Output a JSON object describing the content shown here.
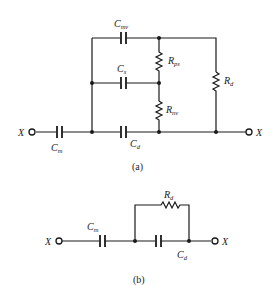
{
  "diagram_a": {
    "caption": "(a)",
    "terminal_left": "X",
    "terminal_right": "X",
    "components": {
      "C_mv": {
        "main": "C",
        "sub": "mv"
      },
      "C_s": {
        "main": "C",
        "sub": "s"
      },
      "C_d": {
        "main": "C",
        "sub": "d"
      },
      "C_m": {
        "main": "C",
        "sub": "m"
      },
      "R_ps": {
        "main": "R",
        "sub": "ps"
      },
      "R_nv": {
        "main": "R",
        "sub": "nv"
      },
      "R_d": {
        "main": "R",
        "sub": "d"
      }
    }
  },
  "diagram_b": {
    "caption": "(b)",
    "terminal_left": "X",
    "terminal_right": "X",
    "components": {
      "C_m": {
        "main": "C",
        "sub": "m"
      },
      "R_d": {
        "main": "R",
        "sub": "d"
      },
      "C_d": {
        "main": "C",
        "sub": "d"
      }
    }
  }
}
